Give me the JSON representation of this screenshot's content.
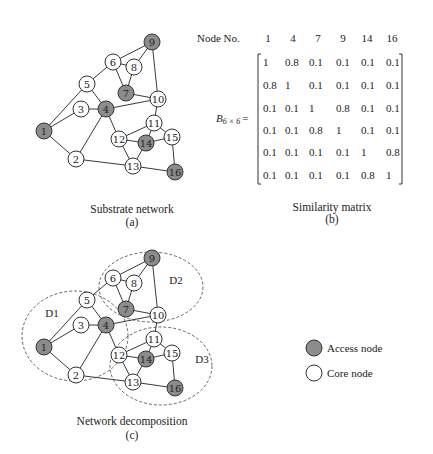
{
  "figure": {
    "panel_a": {
      "caption": "Substrate network",
      "sub_label": "(a)"
    },
    "panel_b": {
      "caption": "Similarity matrix",
      "sub_label": "(b)",
      "header_label": "Node No.",
      "matrix_label": "B",
      "matrix_subscript": "6 × 6",
      "matrix_equals": "=",
      "columns": [
        "1",
        "4",
        "7",
        "9",
        "14",
        "16"
      ],
      "rows": [
        [
          "1",
          "0.8",
          "0.1",
          "0.1",
          "0.1",
          "0.1"
        ],
        [
          "0.8",
          "1",
          "0.1",
          "0.1",
          "0.1",
          "0.1"
        ],
        [
          "0.1",
          "0.1",
          "1",
          "0.8",
          "0.1",
          "0.1"
        ],
        [
          "0.1",
          "0.1",
          "0.8",
          "1",
          "0.1",
          "0.1"
        ],
        [
          "0.1",
          "0.1",
          "0.1",
          "0.1",
          "1",
          "0.8"
        ],
        [
          "0.1",
          "0.1",
          "0.1",
          "0.1",
          "0.8",
          "1"
        ]
      ]
    },
    "panel_c": {
      "caption": "Network decomposition",
      "sub_label": "(c)",
      "domains": [
        {
          "label": "D1",
          "cx": 75,
          "cy": 336,
          "rx": 53,
          "ry": 45,
          "lx": 52,
          "ly": 313
        },
        {
          "label": "D2",
          "cx": 151,
          "cy": 287,
          "rx": 52,
          "ry": 35,
          "lx": 176,
          "ly": 280
        },
        {
          "label": "D3",
          "cx": 161,
          "cy": 366,
          "rx": 51,
          "ry": 39,
          "lx": 202,
          "ly": 359
        }
      ]
    },
    "legend": {
      "access_label": "Access node",
      "core_label": "Core node"
    },
    "colors": {
      "access_fill": "#8c8c8c",
      "core_fill": "#ffffff",
      "stroke": "#333333"
    },
    "network": {
      "nodes": [
        {
          "id": "1",
          "x": 44,
          "y": 131,
          "type": "access"
        },
        {
          "id": "2",
          "x": 76,
          "y": 159,
          "type": "core"
        },
        {
          "id": "3",
          "x": 81,
          "y": 109,
          "type": "core"
        },
        {
          "id": "4",
          "x": 106,
          "y": 109,
          "type": "access"
        },
        {
          "id": "5",
          "x": 87,
          "y": 84,
          "type": "core"
        },
        {
          "id": "6",
          "x": 113,
          "y": 62,
          "type": "core"
        },
        {
          "id": "7",
          "x": 126,
          "y": 93,
          "type": "access"
        },
        {
          "id": "8",
          "x": 134,
          "y": 67,
          "type": "core"
        },
        {
          "id": "9",
          "x": 152,
          "y": 42,
          "type": "access"
        },
        {
          "id": "10",
          "x": 158,
          "y": 99,
          "type": "core"
        },
        {
          "id": "11",
          "x": 154,
          "y": 123,
          "type": "core"
        },
        {
          "id": "12",
          "x": 119,
          "y": 139,
          "type": "core"
        },
        {
          "id": "13",
          "x": 133,
          "y": 166,
          "type": "core"
        },
        {
          "id": "14",
          "x": 146,
          "y": 143,
          "type": "access"
        },
        {
          "id": "15",
          "x": 172,
          "y": 137,
          "type": "core"
        },
        {
          "id": "16",
          "x": 175,
          "y": 172,
          "type": "access"
        }
      ],
      "edges": [
        [
          "1",
          "5"
        ],
        [
          "1",
          "3"
        ],
        [
          "1",
          "2"
        ],
        [
          "3",
          "4"
        ],
        [
          "5",
          "4"
        ],
        [
          "5",
          "6"
        ],
        [
          "6",
          "9"
        ],
        [
          "6",
          "8"
        ],
        [
          "6",
          "7"
        ],
        [
          "8",
          "9"
        ],
        [
          "8",
          "7"
        ],
        [
          "9",
          "10"
        ],
        [
          "7",
          "10"
        ],
        [
          "4",
          "10"
        ],
        [
          "4",
          "2"
        ],
        [
          "4",
          "12"
        ],
        [
          "10",
          "11"
        ],
        [
          "11",
          "12"
        ],
        [
          "11",
          "14"
        ],
        [
          "11",
          "15"
        ],
        [
          "12",
          "14"
        ],
        [
          "12",
          "13"
        ],
        [
          "14",
          "15"
        ],
        [
          "14",
          "13"
        ],
        [
          "2",
          "13"
        ],
        [
          "13",
          "16"
        ],
        [
          "15",
          "16"
        ]
      ]
    }
  }
}
